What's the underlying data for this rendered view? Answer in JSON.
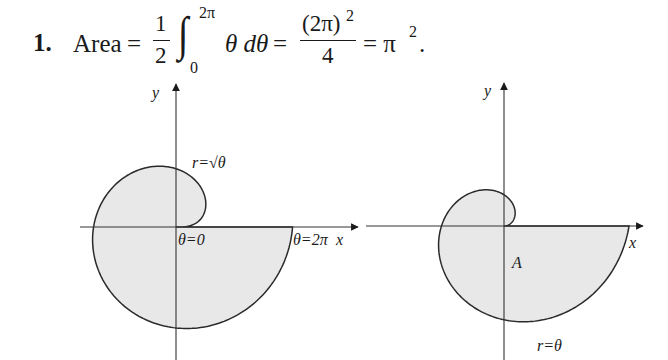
{
  "problem": {
    "number": "1.",
    "lhs": "Area",
    "eq1": "=",
    "half_num": "1",
    "half_den": "2",
    "integral_sign": "∫",
    "upper_limit": "2π",
    "lower_limit": "0",
    "integrand": "θ dθ",
    "eq2": "=",
    "frac2_num": "(2π)",
    "frac2_num_exp": "2",
    "frac2_den": "4",
    "eq3": "= π",
    "result_exp": "2",
    "period": "."
  },
  "figures": [
    {
      "id": "left",
      "curve": "r = sqrt(theta)",
      "theta_range": [
        0,
        6.2832
      ],
      "origin_px": [
        176,
        227
      ],
      "scale_px_per_unit": 46.5,
      "x_axis_px": [
        80,
        358
      ],
      "y_axis_px": [
        84,
        360
      ],
      "fill": "#e8e8e8",
      "stroke": "#2a2a2a",
      "labels": {
        "y": "y",
        "curve": "r=√θ",
        "start": "θ=0",
        "end": "θ=2π",
        "x": "x"
      }
    },
    {
      "id": "right",
      "curve": "r = theta",
      "theta_range": [
        0,
        6.2832
      ],
      "origin_px": [
        504,
        226
      ],
      "scale_px_per_unit": 19.9,
      "x_axis_px": [
        366,
        643
      ],
      "y_axis_px": [
        83,
        360
      ],
      "fill": "#e8e8e8",
      "stroke": "#2a2a2a",
      "labels": {
        "y": "y",
        "x": "x",
        "region": "A",
        "curve": "r=θ"
      }
    }
  ]
}
